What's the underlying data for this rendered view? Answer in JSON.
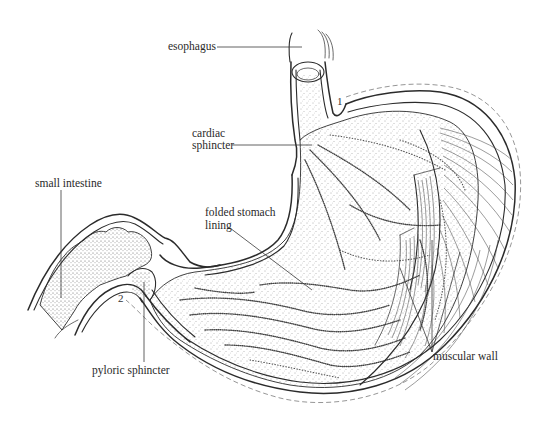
{
  "figure": {
    "labels": {
      "esophagus": "esophagus",
      "cardiac_sphincter_line1": "cardiac",
      "cardiac_sphincter_line2": "sphincter",
      "small_intestine": "small intestine",
      "folded_lining_line1": "folded stomach",
      "folded_lining_line2": "lining",
      "pyloric_sphincter": "pyloric sphincter",
      "muscular_wall": "muscular wall"
    },
    "markers": {
      "marker_1": "1",
      "marker_2": "2"
    },
    "colors": {
      "ink": "#2b2b2b",
      "dashed_outline": "#8a8a8a",
      "background": "#ffffff"
    }
  }
}
